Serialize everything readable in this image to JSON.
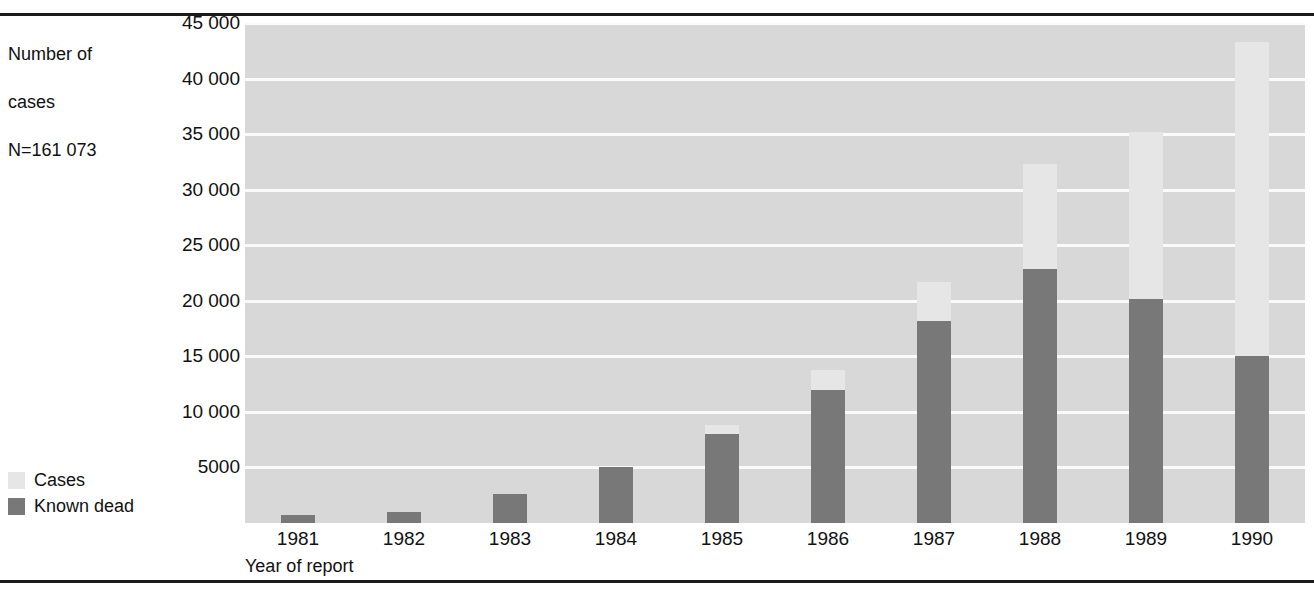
{
  "axis_caption": {
    "line1": "Number of",
    "line2": "cases",
    "line3": "N=161 073"
  },
  "x_axis_title": "Year of report",
  "legend": {
    "items": [
      {
        "label": "Cases",
        "color": "#e6e6e6"
      },
      {
        "label": "Known dead",
        "color": "#787878"
      }
    ]
  },
  "chart_data": {
    "type": "bar",
    "stacked": "overlay",
    "title": "",
    "subtitle": "",
    "xlabel": "Year of report",
    "ylabel": "Number of cases",
    "total_label": "N=161 073",
    "categories": [
      "1981",
      "1982",
      "1983",
      "1984",
      "1985",
      "1986",
      "1987",
      "1988",
      "1989",
      "1990"
    ],
    "series": [
      {
        "name": "Cases",
        "color": "#e6e6e6",
        "values": [
          700,
          1000,
          2600,
          5000,
          8800,
          13800,
          21700,
          32300,
          35200,
          43300
        ]
      },
      {
        "name": "Known dead",
        "color": "#787878",
        "values": [
          700,
          1000,
          2600,
          5000,
          8000,
          12000,
          18200,
          22900,
          20200,
          15000
        ]
      }
    ],
    "ylim": [
      0,
      45000
    ],
    "ytick_values": [
      5000,
      10000,
      15000,
      20000,
      25000,
      30000,
      35000,
      40000,
      45000
    ],
    "ytick_labels": [
      "5000",
      "10 000",
      "15 000",
      "20 000",
      "25 000",
      "30 000",
      "35 000",
      "40 000",
      "45 000"
    ],
    "grid": "horizontal",
    "legend_position": "outside-left-bottom",
    "plot_background": "#d8d8d8",
    "gridline_color": "#fafafa"
  }
}
